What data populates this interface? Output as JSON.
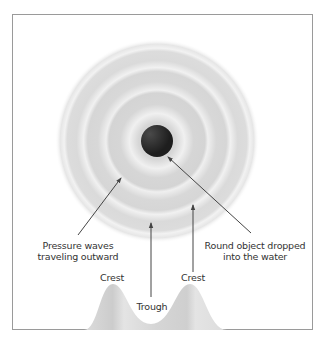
{
  "diagram": {
    "labels": {
      "pressure_waves_line1": "Pressure waves",
      "pressure_waves_line2": "traveling outward",
      "object_line1": "Round object dropped",
      "object_line2": "into the water",
      "crest_left": "Crest",
      "crest_right": "Crest",
      "trough": "Trough"
    },
    "colors": {
      "ripple_light": "#f2f2f2",
      "ripple_dark": "#d4d4d4",
      "ball": "#2b2b2b",
      "wave_profile": "#d0d0d0",
      "arrow": "#444444",
      "border": "#9a9a9a"
    },
    "ring_count": 4
  }
}
